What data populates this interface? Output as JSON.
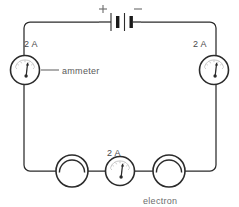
{
  "diagram": {
    "line_color": "#2b2b2b",
    "text_color": "#555555"
  },
  "battery": {
    "positive_label": "+",
    "negative_label": "−",
    "cells": 2
  },
  "ammeters": [
    {
      "id": "left",
      "reading": "2 A",
      "position": "left-side"
    },
    {
      "id": "right",
      "reading": "2 A",
      "position": "right-side"
    },
    {
      "id": "bottom",
      "reading": "2 A",
      "position": "bottom-middle"
    }
  ],
  "callouts": [
    {
      "id": "ammeter-callout",
      "text": "ammeter"
    }
  ],
  "lamps": [
    {
      "id": "lamp-left",
      "position": "bottom-left"
    },
    {
      "id": "lamp-right",
      "position": "bottom-right"
    }
  ],
  "annotations": {
    "electron_label": "electron"
  }
}
